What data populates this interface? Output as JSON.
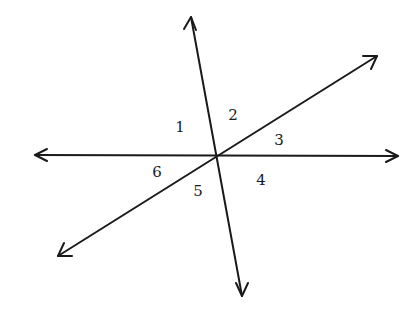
{
  "diagram": {
    "title": "",
    "stroke_color": "#1a1a1a",
    "background": "#ffffff",
    "intersection": {
      "x": 217,
      "y": 156
    },
    "lines": [
      {
        "name": "horizontal-line",
        "x1": 35,
        "y1": 155,
        "x2": 398,
        "y2": 156
      },
      {
        "name": "steep-line",
        "x1": 191,
        "y1": 17,
        "x2": 242,
        "y2": 296
      },
      {
        "name": "diagonal-line",
        "x1": 58,
        "y1": 256,
        "x2": 377,
        "y2": 56
      }
    ],
    "angles": [
      {
        "label": "1",
        "x": 180,
        "y": 132
      },
      {
        "label": "2",
        "x": 233,
        "y": 120
      },
      {
        "label": "3",
        "x": 279,
        "y": 145
      },
      {
        "label": "4",
        "x": 261,
        "y": 185
      },
      {
        "label": "5",
        "x": 198,
        "y": 196
      },
      {
        "label": "6",
        "x": 157,
        "y": 177
      }
    ]
  }
}
